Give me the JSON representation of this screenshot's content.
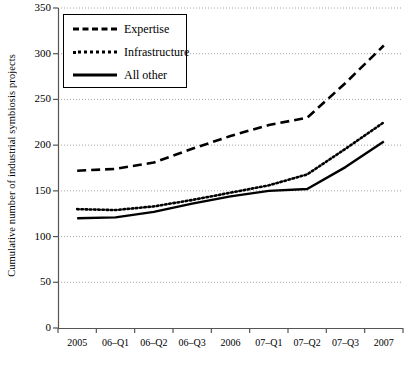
{
  "chart_data": {
    "type": "line",
    "title": "",
    "xlabel": "",
    "ylabel": "Cumulative number of industrial symbiosis projects",
    "categories": [
      "2005",
      "06–Q1",
      "06–Q2",
      "06–Q3",
      "2006",
      "07–Q1",
      "07–Q2",
      "07–Q3",
      "2007"
    ],
    "ylim": [
      0,
      350
    ],
    "ytick_values": [
      0,
      50,
      100,
      150,
      200,
      250,
      300,
      350
    ],
    "ytick_labels": [
      "0",
      "50",
      "100",
      "150",
      "200",
      "250",
      "300",
      "350"
    ],
    "grid": true,
    "grid_style": "dotted-horizontal",
    "legend_position": "top-left",
    "series": [
      {
        "name": "Expertise",
        "style": "dashed",
        "color": "#000000",
        "values": [
          172,
          174,
          181,
          196,
          210,
          222,
          230,
          268,
          309
        ]
      },
      {
        "name": "Infrastructure",
        "style": "dotted",
        "color": "#000000",
        "values": [
          130,
          129,
          133,
          140,
          148,
          156,
          168,
          196,
          225
        ]
      },
      {
        "name": "All other",
        "style": "solid",
        "color": "#000000",
        "values": [
          120,
          121,
          127,
          136,
          144,
          150,
          152,
          176,
          204
        ]
      }
    ]
  },
  "axes": {
    "y_axis_label": "Cumulative number of industrial symbiosis projects"
  },
  "legend": {
    "items": [
      {
        "label": "Expertise",
        "key": "dashed-line-key"
      },
      {
        "label": "Infrastructure",
        "key": "dotted-line-key"
      },
      {
        "label": "All other",
        "key": "solid-line-key"
      }
    ]
  }
}
